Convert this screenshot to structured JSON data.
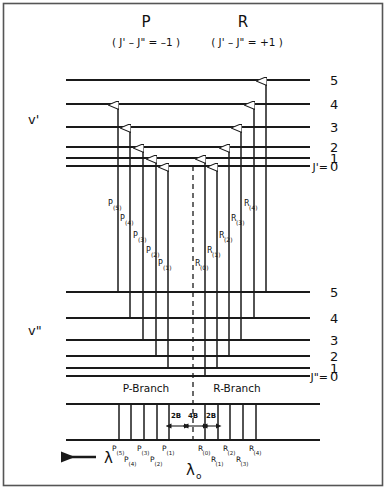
{
  "figure": {
    "title_p": "P",
    "title_r": "R",
    "subtitle_p": "( J' – J\" = –1 )",
    "subtitle_r": "( J' – J\" = +1 )",
    "upper_state_label": "v'",
    "lower_state_label": "v\"",
    "upper_j_eq": "J'=",
    "lower_j_eq": "J\"=",
    "p_branch_label": "P-Branch",
    "r_branch_label": "R-Branch",
    "wavelength_symbol": "λ",
    "origin_symbol": "λ",
    "origin_subscript": "o",
    "line_color": "#1a1a1a",
    "background": "#ffffff",
    "border_color": "#555555"
  },
  "chart_data": {
    "type": "diagram",
    "upper_levels": [
      {
        "j": "5",
        "y": 80
      },
      {
        "j": "4",
        "y": 104
      },
      {
        "j": "3",
        "y": 127
      },
      {
        "j": "2",
        "y": 147
      },
      {
        "j": "1",
        "y": 158
      },
      {
        "j": "0",
        "y": 166
      }
    ],
    "lower_levels": [
      {
        "j": "5",
        "y": 292
      },
      {
        "j": "4",
        "y": 318
      },
      {
        "j": "3",
        "y": 340
      },
      {
        "j": "2",
        "y": 356
      },
      {
        "j": "1",
        "y": 368
      },
      {
        "j": "0",
        "y": 376
      }
    ],
    "transitions": [
      {
        "name": "P",
        "n": "5",
        "x": 118,
        "top": 104,
        "bottom": 292,
        "label_y": 206
      },
      {
        "name": "P",
        "n": "4",
        "x": 130,
        "top": 127,
        "bottom": 318,
        "label_y": 221
      },
      {
        "name": "P",
        "n": "3",
        "x": 143,
        "top": 147,
        "bottom": 340,
        "label_y": 238
      },
      {
        "name": "P",
        "n": "2",
        "x": 156,
        "top": 158,
        "bottom": 356,
        "label_y": 253
      },
      {
        "name": "P",
        "n": "1",
        "x": 168,
        "top": 166,
        "bottom": 368,
        "label_y": 266
      },
      {
        "name": "R",
        "n": "0",
        "x": 205,
        "top": 158,
        "bottom": 376,
        "label_y": 266
      },
      {
        "name": "R",
        "n": "1",
        "x": 217,
        "top": 166,
        "bottom": 368,
        "label_y": 253
      },
      {
        "name": "R",
        "n": "2",
        "x": 229,
        "top": 147,
        "bottom": 356,
        "label_y": 238
      },
      {
        "name": "R",
        "n": "3",
        "x": 241,
        "top": 127,
        "bottom": 340,
        "label_y": 221
      },
      {
        "name": "R",
        "n": "4",
        "x": 254,
        "top": 104,
        "bottom": 318,
        "label_y": 206
      },
      {
        "name": "R",
        "n": "4b",
        "x": 266,
        "top": 80,
        "bottom": 292,
        "label_y": 206
      }
    ],
    "origin_line_x": 193,
    "spectrum": {
      "top_y": 404,
      "bottom_y": 440,
      "left_x": 66,
      "right_x": 320,
      "spacing_labels": [
        {
          "text": "2B",
          "x": 176
        },
        {
          "text": "4B",
          "x": 193
        },
        {
          "text": "2B",
          "x": 211
        }
      ],
      "lines": [
        {
          "label": "P",
          "n": "5",
          "x": 119,
          "row": 0
        },
        {
          "label": "P",
          "n": "4",
          "x": 131,
          "row": 1
        },
        {
          "label": "P",
          "n": "3",
          "x": 144,
          "row": 0
        },
        {
          "label": "P",
          "n": "2",
          "x": 157,
          "row": 1
        },
        {
          "label": "P",
          "n": "1",
          "x": 169,
          "row": 0
        },
        {
          "label": "R",
          "n": "0",
          "x": 205,
          "row": 0
        },
        {
          "label": "R",
          "n": "1",
          "x": 218,
          "row": 1
        },
        {
          "label": "R",
          "n": "2",
          "x": 230,
          "row": 0
        },
        {
          "label": "R",
          "n": "3",
          "x": 243,
          "row": 1
        },
        {
          "label": "R",
          "n": "4",
          "x": 256,
          "row": 0
        }
      ]
    },
    "level_left_x": 66,
    "level_right_x": 310,
    "j_label_x": 330
  }
}
